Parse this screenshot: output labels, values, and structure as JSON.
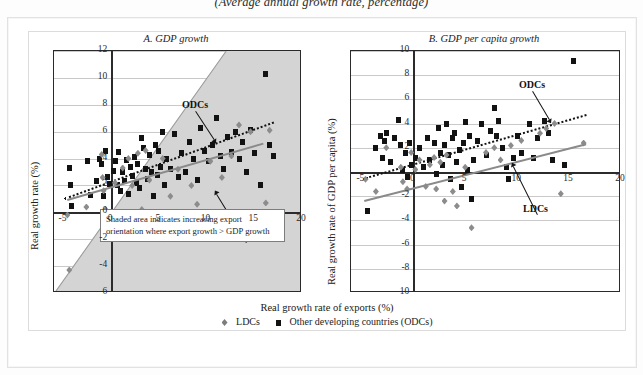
{
  "figure": {
    "caption": "(Average annual growth rate, percentage)",
    "xlabel": "Real growth rate of exports (%)",
    "legend": [
      {
        "marker": "diamond-icon",
        "label": "LDCs"
      },
      {
        "marker": "square-icon",
        "label": "Other developing countries (ODCs)"
      }
    ]
  },
  "colors": {
    "odc_marker": "#121212",
    "ldc_marker": "#8c8c8c",
    "odc_trend": "#111111",
    "ldc_trend": "#8a8a8a",
    "shade": "#d4d4d4",
    "grid": "#c9c9c9",
    "axis": "#2b2b2b"
  },
  "annotations": {
    "odc_label": "ODCs",
    "ldc_label": "LDCs",
    "note_line1": "Shaded area indicates increasing export",
    "note_line2": "orientation where export growth > GDP growth"
  },
  "chart_data": [
    {
      "id": "panel_a",
      "type": "scatter",
      "title": "A. GDP growth",
      "xlabel": "Real growth rate of exports (%)",
      "ylabel": "Real growth rate (%)",
      "xlim": [
        -6,
        20
      ],
      "ylim": [
        -6,
        12
      ],
      "xticks": [
        -5,
        0,
        5,
        10,
        15,
        20
      ],
      "yticks": [
        -6,
        -4,
        -2,
        0,
        2,
        4,
        6,
        8,
        10,
        12
      ],
      "grid": true,
      "shaded_region": {
        "label": "export growth > GDP growth",
        "boundary": "y = x",
        "note": "Shaded area indicates increasing export orientation where export growth > GDP growth"
      },
      "series": [
        {
          "name": "Other developing countries (ODCs)",
          "marker": "square",
          "trendline": {
            "style": "dotted",
            "x": [
              -5,
              17
            ],
            "y": [
              1.1,
              6.8
            ]
          },
          "points": [
            [
              -4.4,
              3.3
            ],
            [
              -4.3,
              2.0
            ],
            [
              -4.2,
              0.5
            ],
            [
              -2.5,
              3.8
            ],
            [
              -2.2,
              1.3
            ],
            [
              -1.6,
              2.3
            ],
            [
              -1.2,
              4.0
            ],
            [
              -1.0,
              3.6
            ],
            [
              -0.8,
              1.2
            ],
            [
              -0.6,
              4.6
            ],
            [
              -0.4,
              2.6
            ],
            [
              -0.2,
              2.1
            ],
            [
              0.2,
              3.1
            ],
            [
              0.4,
              3.8
            ],
            [
              0.6,
              2.0
            ],
            [
              0.8,
              4.5
            ],
            [
              1.0,
              1.6
            ],
            [
              1.2,
              3.0
            ],
            [
              1.4,
              2.3
            ],
            [
              1.6,
              3.9
            ],
            [
              1.8,
              1.4
            ],
            [
              2.0,
              3.4
            ],
            [
              2.2,
              2.7
            ],
            [
              2.4,
              4.1
            ],
            [
              2.6,
              2.2
            ],
            [
              2.8,
              3.6
            ],
            [
              3.0,
              1.8
            ],
            [
              3.2,
              5.5
            ],
            [
              3.4,
              4.8
            ],
            [
              3.6,
              3.2
            ],
            [
              3.8,
              2.5
            ],
            [
              4.0,
              4.3
            ],
            [
              4.2,
              3.0
            ],
            [
              4.4,
              1.2
            ],
            [
              4.6,
              5.0
            ],
            [
              4.8,
              2.8
            ],
            [
              5.0,
              4.6
            ],
            [
              5.2,
              3.4
            ],
            [
              5.4,
              6.0
            ],
            [
              5.6,
              2.0
            ],
            [
              5.8,
              4.0
            ],
            [
              6.2,
              3.2
            ],
            [
              6.6,
              5.8
            ],
            [
              7.0,
              2.6
            ],
            [
              7.4,
              4.4
            ],
            [
              7.8,
              3.0
            ],
            [
              8.2,
              5.2
            ],
            [
              8.6,
              4.0
            ],
            [
              9.0,
              2.4
            ],
            [
              9.4,
              6.3
            ],
            [
              9.8,
              4.6
            ],
            [
              10.2,
              3.8
            ],
            [
              10.6,
              5.0
            ],
            [
              11.0,
              7.0
            ],
            [
              11.4,
              4.2
            ],
            [
              11.8,
              3.2
            ],
            [
              12.2,
              5.6
            ],
            [
              12.6,
              4.5
            ],
            [
              13.0,
              6.0
            ],
            [
              13.4,
              4.0
            ],
            [
              13.8,
              5.2
            ],
            [
              14.2,
              3.0
            ],
            [
              14.6,
              6.1
            ],
            [
              15.0,
              4.4
            ],
            [
              15.6,
              2.0
            ],
            [
              16.2,
              10.3
            ],
            [
              16.6,
              5.0
            ],
            [
              17.0,
              4.2
            ]
          ]
        },
        {
          "name": "LDCs",
          "marker": "diamond",
          "trendline": {
            "style": "solid",
            "x": [
              -4.6,
              16.0
            ],
            "y": [
              1.0,
              5.2
            ]
          },
          "points": [
            [
              -4.6,
              -0.2
            ],
            [
              -4.4,
              -4.3
            ],
            [
              -2.6,
              0.4
            ],
            [
              -1.0,
              4.3
            ],
            [
              -0.9,
              2.6
            ],
            [
              -0.8,
              1.6
            ],
            [
              -0.6,
              0.2
            ],
            [
              -0.4,
              -1.3
            ],
            [
              0.4,
              2.2
            ],
            [
              1.2,
              3.3
            ],
            [
              1.8,
              4.0
            ],
            [
              2.2,
              2.0
            ],
            [
              2.8,
              4.4
            ],
            [
              3.2,
              0.2
            ],
            [
              3.6,
              4.6
            ],
            [
              4.0,
              2.4
            ],
            [
              4.6,
              -0.6
            ],
            [
              5.4,
              4.0
            ],
            [
              6.2,
              1.2
            ],
            [
              7.0,
              3.2
            ],
            [
              8.4,
              2.0
            ],
            [
              9.0,
              0.6
            ],
            [
              10.4,
              3.8
            ],
            [
              11.6,
              2.6
            ],
            [
              12.6,
              4.2
            ],
            [
              13.4,
              6.5
            ],
            [
              14.6,
              6.0
            ],
            [
              16.2,
              0.7
            ],
            [
              16.6,
              6.1
            ]
          ]
        }
      ]
    },
    {
      "id": "panel_b",
      "type": "scatter",
      "title": "B. GDP per capita growth",
      "xlabel": "Real growth rate of exports (%)",
      "ylabel": "Real growth rate of GDP per capita (%)",
      "xlim": [
        -6,
        20
      ],
      "ylim": [
        -10,
        10
      ],
      "xticks": [
        -5,
        0,
        5,
        10,
        15,
        20
      ],
      "yticks": [
        -10,
        -8,
        -6,
        -4,
        -2,
        0,
        2,
        4,
        6,
        8,
        10
      ],
      "grid": true,
      "series": [
        {
          "name": "Other developing countries (ODCs)",
          "marker": "square",
          "trendline": {
            "style": "dotted",
            "x": [
              -4.6,
              16.6
            ],
            "y": [
              -0.4,
              4.8
            ]
          },
          "points": [
            [
              -4.4,
              -3.2
            ],
            [
              -3.6,
              2.0
            ],
            [
              -3.2,
              3.0
            ],
            [
              -3.0,
              1.2
            ],
            [
              -2.8,
              2.6
            ],
            [
              -2.6,
              3.2
            ],
            [
              -2.2,
              0.8
            ],
            [
              -1.8,
              2.8
            ],
            [
              -1.4,
              4.3
            ],
            [
              -1.2,
              2.2
            ],
            [
              -1.0,
              0.2
            ],
            [
              -0.8,
              1.6
            ],
            [
              -0.6,
              -0.4
            ],
            [
              -0.4,
              2.4
            ],
            [
              -0.2,
              0.6
            ],
            [
              0.2,
              1.2
            ],
            [
              0.6,
              2.0
            ],
            [
              1.0,
              0.4
            ],
            [
              1.4,
              2.8
            ],
            [
              1.6,
              1.0
            ],
            [
              2.0,
              2.4
            ],
            [
              2.2,
              -0.2
            ],
            [
              2.4,
              3.6
            ],
            [
              2.6,
              1.6
            ],
            [
              2.8,
              0.6
            ],
            [
              3.0,
              2.2
            ],
            [
              3.2,
              4.0
            ],
            [
              3.4,
              1.4
            ],
            [
              3.6,
              -0.6
            ],
            [
              3.8,
              2.8
            ],
            [
              4.0,
              3.2
            ],
            [
              4.2,
              0.8
            ],
            [
              4.4,
              1.8
            ],
            [
              4.6,
              -1.2
            ],
            [
              4.8,
              2.4
            ],
            [
              5.0,
              4.1
            ],
            [
              5.2,
              0.2
            ],
            [
              5.4,
              3.0
            ],
            [
              5.6,
              -2.2
            ],
            [
              5.8,
              1.0
            ],
            [
              6.2,
              2.6
            ],
            [
              6.6,
              4.0
            ],
            [
              7.0,
              1.4
            ],
            [
              7.4,
              3.4
            ],
            [
              7.8,
              5.3
            ],
            [
              8.0,
              3.0
            ],
            [
              8.2,
              4.2
            ],
            [
              8.6,
              2.0
            ],
            [
              9.0,
              0.4
            ],
            [
              9.2,
              -0.6
            ],
            [
              9.6,
              1.2
            ],
            [
              10.0,
              3.0
            ],
            [
              10.4,
              1.6
            ],
            [
              11.2,
              4.0
            ],
            [
              11.6,
              1.2
            ],
            [
              12.0,
              2.8
            ],
            [
              12.6,
              4.2
            ],
            [
              13.0,
              3.2
            ],
            [
              13.4,
              1.0
            ],
            [
              14.6,
              0.6
            ],
            [
              15.4,
              9.2
            ]
          ]
        },
        {
          "name": "LDCs",
          "marker": "diamond",
          "trendline": {
            "style": "solid",
            "x": [
              -4.8,
              16.6
            ],
            "y": [
              -2.3,
              2.4
            ]
          },
          "points": [
            [
              -4.6,
              -0.6
            ],
            [
              -3.6,
              -1.6
            ],
            [
              -2.6,
              2.0
            ],
            [
              -1.2,
              0.4
            ],
            [
              -1.0,
              -0.8
            ],
            [
              -0.6,
              -1.4
            ],
            [
              -0.2,
              1.6
            ],
            [
              0.2,
              0.2
            ],
            [
              0.6,
              1.0
            ],
            [
              1.2,
              -1.2
            ],
            [
              1.6,
              0.6
            ],
            [
              2.0,
              1.2
            ],
            [
              2.2,
              -1.4
            ],
            [
              2.6,
              0.8
            ],
            [
              3.0,
              -2.4
            ],
            [
              3.2,
              1.4
            ],
            [
              3.8,
              -1.6
            ],
            [
              4.2,
              -2.8
            ],
            [
              5.0,
              0.4
            ],
            [
              5.6,
              -4.6
            ],
            [
              7.0,
              1.6
            ],
            [
              7.8,
              2.0
            ],
            [
              8.4,
              1.0
            ],
            [
              9.4,
              2.2
            ],
            [
              10.4,
              2.6
            ],
            [
              12.2,
              3.2
            ],
            [
              12.8,
              3.6
            ],
            [
              13.6,
              4.0
            ],
            [
              14.2,
              -1.8
            ],
            [
              16.4,
              2.4
            ]
          ]
        }
      ]
    }
  ]
}
